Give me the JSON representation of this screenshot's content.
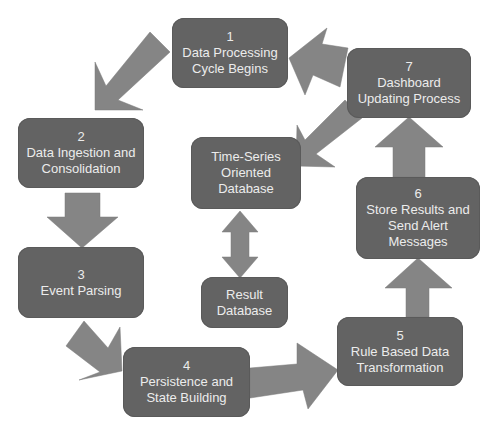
{
  "diagram": {
    "type": "cycle-flowchart",
    "colors": {
      "box_fill": "#636363",
      "arrow_fill": "#858585",
      "text": "#ececec",
      "background": "#ffffff"
    },
    "steps": [
      {
        "number": "1",
        "label": "Data Processing\nCycle Begins"
      },
      {
        "number": "2",
        "label": "Data Ingestion and\nConsolidation"
      },
      {
        "number": "3",
        "label": "Event Parsing"
      },
      {
        "number": "4",
        "label": "Persistence and\nState Building"
      },
      {
        "number": "5",
        "label": "Rule Based Data\nTransformation"
      },
      {
        "number": "6",
        "label": "Store Results and\nSend Alert\nMessages"
      },
      {
        "number": "7",
        "label": "Dashboard\nUpdating Process"
      }
    ],
    "databases": [
      {
        "label": "Time-Series\nOriented\nDatabase"
      },
      {
        "label": "Result\nDatabase"
      }
    ],
    "connections": [
      {
        "from": "1",
        "to": "2"
      },
      {
        "from": "2",
        "to": "3"
      },
      {
        "from": "3",
        "to": "4"
      },
      {
        "from": "4",
        "to": "5"
      },
      {
        "from": "5",
        "to": "6"
      },
      {
        "from": "6",
        "to": "7"
      },
      {
        "from": "7",
        "to": "1"
      },
      {
        "from": "7",
        "to": "Time-Series Oriented Database"
      },
      {
        "from": "Time-Series Oriented Database",
        "to": "Result Database",
        "bidirectional": true
      }
    ]
  }
}
